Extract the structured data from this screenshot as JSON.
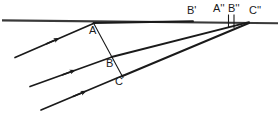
{
  "figure": {
    "type": "geometry-diagram",
    "stroke_color": "#1a1a1a",
    "background_color": "#ffffff",
    "labels": {
      "A": "A",
      "B": "B",
      "C": "C",
      "B_prime": "B'",
      "A_double_prime": "A''",
      "B_double_prime": "B''",
      "C_double_prime": "C''"
    },
    "points": [
      {
        "name": "A",
        "text": "A",
        "x": 93,
        "y": 23
      },
      {
        "name": "B",
        "text": "B",
        "x": 110,
        "y": 57
      },
      {
        "name": "C",
        "text": "C",
        "x": 120,
        "y": 74
      },
      {
        "name": "B'",
        "text": "B'",
        "x": 192,
        "y": 21
      },
      {
        "name": "A''",
        "text": "A''",
        "x": 228,
        "y": 22
      },
      {
        "name": "B''",
        "text": "B''",
        "x": 233,
        "y": 22
      },
      {
        "name": "C''",
        "text": "C''",
        "x": 248,
        "y": 22
      }
    ],
    "parallel_lines": [
      {
        "name": "line-1",
        "x1": 15,
        "y1": 57,
        "x2": 94,
        "y2": 23,
        "arrow_at": 0.52
      },
      {
        "name": "line-2",
        "x1": 30,
        "y1": 86,
        "x2": 111,
        "y2": 57,
        "arrow_at": 0.52
      },
      {
        "name": "line-3",
        "x1": 41,
        "y1": 110,
        "x2": 122,
        "y2": 75,
        "arrow_at": 0.52
      }
    ],
    "transversal": {
      "name": "transversal-ABC",
      "x1": 93,
      "y1": 23,
      "x2": 122,
      "y2": 77
    },
    "horizontal_line": {
      "name": "horizontal-baseline",
      "x1": 2,
      "y1": 20,
      "x2": 278,
      "y2": 23
    },
    "rays": [
      {
        "name": "ray-upper",
        "x1": 93,
        "y1": 23,
        "x2": 192,
        "y2": 21
      },
      {
        "name": "ray-to-C-double-prime-upper",
        "x1": 111,
        "y1": 57,
        "x2": 248,
        "y2": 22
      },
      {
        "name": "ray-to-C-double-prime-lower",
        "x1": 122,
        "y1": 76,
        "x2": 248,
        "y2": 23
      },
      {
        "name": "ray-from-Bprime",
        "x1": 192,
        "y1": 21,
        "x2": 248,
        "y2": 22
      }
    ],
    "tick_marks": [
      {
        "name": "tick-A-double-prime",
        "x": 228,
        "y_top": 14,
        "y_bottom": 28
      },
      {
        "name": "tick-B-double-prime",
        "x": 234,
        "y_top": 14,
        "y_bottom": 28
      }
    ]
  }
}
